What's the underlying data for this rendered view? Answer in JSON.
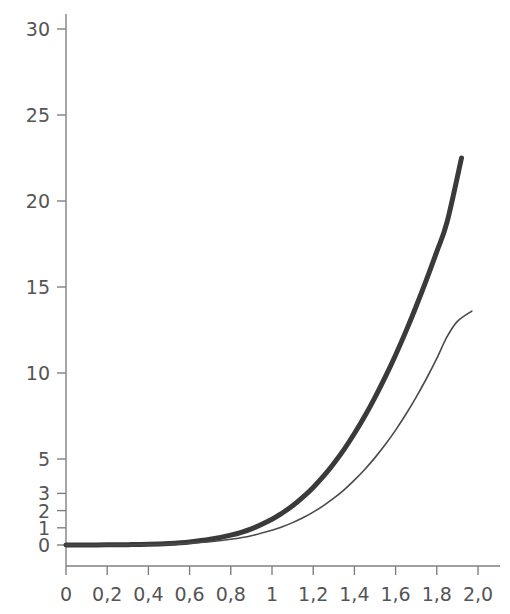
{
  "chart_data": {
    "type": "line",
    "title": "",
    "subtitle": "",
    "xlabel": "",
    "ylabel": "",
    "xlim": [
      0,
      2.12
    ],
    "ylim": [
      0,
      31.2
    ],
    "grid": false,
    "legend": "none",
    "decimal_separator": ",",
    "x_ticks": [
      {
        "value": 0,
        "label": "0"
      },
      {
        "value": 0.2,
        "label": "0,2"
      },
      {
        "value": 0.4,
        "label": "0,4"
      },
      {
        "value": 0.6,
        "label": "0,6"
      },
      {
        "value": 0.8,
        "label": "0,8"
      },
      {
        "value": 1.0,
        "label": "1"
      },
      {
        "value": 1.2,
        "label": "1,2"
      },
      {
        "value": 1.4,
        "label": "1,4"
      },
      {
        "value": 1.6,
        "label": "1,6"
      },
      {
        "value": 1.8,
        "label": "1,8"
      },
      {
        "value": 2.0,
        "label": "2,0"
      }
    ],
    "y_ticks": [
      {
        "value": 0,
        "label": "0"
      },
      {
        "value": 1,
        "label": "1"
      },
      {
        "value": 2,
        "label": "2"
      },
      {
        "value": 3,
        "label": "3"
      },
      {
        "value": 5,
        "label": "5"
      },
      {
        "value": 10,
        "label": "10"
      },
      {
        "value": 15,
        "label": "15"
      },
      {
        "value": 20,
        "label": "20"
      },
      {
        "value": 25,
        "label": "25"
      },
      {
        "value": 30,
        "label": "30"
      }
    ],
    "series": [
      {
        "name": "upper-curve",
        "style": "thick",
        "color": "#3a3a3a",
        "line_width": 5,
        "x": [
          0.0,
          0.1,
          0.2,
          0.3,
          0.4,
          0.5,
          0.6,
          0.7,
          0.8,
          0.9,
          1.0,
          1.05,
          1.1,
          1.15,
          1.2,
          1.25,
          1.3,
          1.35,
          1.4,
          1.45,
          1.5,
          1.55,
          1.6,
          1.65,
          1.7,
          1.75,
          1.8,
          1.85,
          1.92
        ],
        "y": [
          0.0,
          0.0,
          0.01,
          0.02,
          0.04,
          0.09,
          0.18,
          0.33,
          0.57,
          0.94,
          1.5,
          1.86,
          2.28,
          2.78,
          3.35,
          4.0,
          4.74,
          5.56,
          6.48,
          7.48,
          8.58,
          9.77,
          11.05,
          12.42,
          13.88,
          15.43,
          17.06,
          18.78,
          22.5
        ]
      },
      {
        "name": "lower-curve",
        "style": "thin",
        "color": "#4a4a4a",
        "line_width": 1.6,
        "x": [
          0.0,
          0.1,
          0.2,
          0.3,
          0.4,
          0.5,
          0.6,
          0.7,
          0.8,
          0.9,
          1.0,
          1.05,
          1.1,
          1.15,
          1.2,
          1.25,
          1.3,
          1.35,
          1.4,
          1.45,
          1.5,
          1.55,
          1.6,
          1.65,
          1.7,
          1.75,
          1.8,
          1.85,
          1.9,
          1.97
        ],
        "y": [
          0.0,
          0.0,
          0.0,
          0.01,
          0.02,
          0.05,
          0.1,
          0.19,
          0.33,
          0.54,
          0.86,
          1.06,
          1.3,
          1.58,
          1.91,
          2.29,
          2.72,
          3.21,
          3.77,
          4.39,
          5.08,
          5.84,
          6.68,
          7.6,
          8.6,
          9.68,
          10.85,
          12.11,
          13.0,
          13.6
        ]
      }
    ]
  },
  "axes": {
    "axis_color": "#808080",
    "tick_color": "#808080",
    "label_color": "#555555",
    "background": "#ffffff"
  }
}
